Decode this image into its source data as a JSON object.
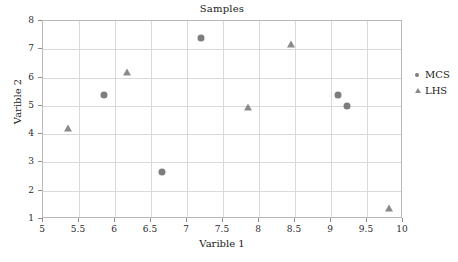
{
  "chart_data": {
    "type": "scatter",
    "title": "Samples",
    "xlabel": "Varible 1",
    "ylabel": "Varible 2",
    "xlim": [
      5,
      10
    ],
    "ylim": [
      1,
      8
    ],
    "xticks": [
      "5",
      "5.5",
      "6",
      "6.5",
      "7",
      "7.5",
      "8",
      "8.5",
      "9",
      "9.5",
      "10"
    ],
    "xtick_values": [
      5,
      5.5,
      6,
      6.5,
      7,
      7.5,
      8,
      8.5,
      9,
      9.5,
      10
    ],
    "yticks": [
      "1",
      "2",
      "3",
      "4",
      "5",
      "6",
      "7",
      "8"
    ],
    "ytick_values": [
      1,
      2,
      3,
      4,
      5,
      6,
      7,
      8
    ],
    "grid": true,
    "legend_position": "right",
    "series": [
      {
        "name": "MCS",
        "marker": "circle",
        "color": "#7d7d7d",
        "points": [
          {
            "x": 5.85,
            "y": 5.4
          },
          {
            "x": 6.65,
            "y": 2.65
          },
          {
            "x": 7.2,
            "y": 7.4
          },
          {
            "x": 9.1,
            "y": 5.4
          },
          {
            "x": 9.22,
            "y": 5.0
          }
        ]
      },
      {
        "name": "LHS",
        "marker": "triangle",
        "color": "#8a8a8a",
        "points": [
          {
            "x": 5.35,
            "y": 4.2
          },
          {
            "x": 6.17,
            "y": 6.2
          },
          {
            "x": 7.85,
            "y": 4.95
          },
          {
            "x": 8.45,
            "y": 7.2
          },
          {
            "x": 9.8,
            "y": 1.4
          }
        ]
      }
    ]
  },
  "legend": {
    "entries": [
      {
        "label": "MCS",
        "marker": "circle"
      },
      {
        "label": "LHS",
        "marker": "triangle"
      }
    ]
  }
}
